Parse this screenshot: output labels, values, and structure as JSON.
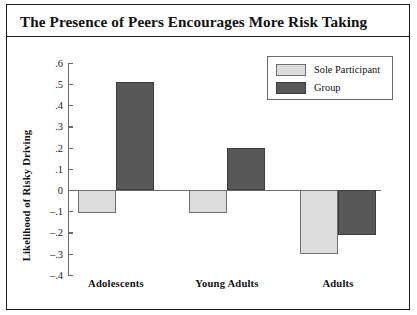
{
  "figure": {
    "title": "The Presence of Peers Encourages More Risk Taking"
  },
  "chart_data": {
    "type": "bar",
    "title": "The Presence of Peers Encourages More Risk Taking",
    "xlabel": "",
    "ylabel": "Likelihood of Risky Driving",
    "categories": [
      "Adolescents",
      "Young Adults",
      "Adults"
    ],
    "series": [
      {
        "name": "Sole Participant",
        "color": "#dcdcdc",
        "values": [
          -0.11,
          -0.11,
          -0.3
        ]
      },
      {
        "name": "Group",
        "color": "#585858",
        "values": [
          0.51,
          0.2,
          -0.21
        ]
      }
    ],
    "ylim": [
      -0.4,
      0.6
    ],
    "ytick_labels": [
      ".6",
      ".5",
      ".4",
      ".3",
      ".2",
      ".1",
      "0",
      "–.1",
      "–.2",
      "–.3",
      "–.4"
    ],
    "ytick_values": [
      0.6,
      0.5,
      0.4,
      0.3,
      0.2,
      0.1,
      0.0,
      -0.1,
      -0.2,
      -0.3,
      -0.4
    ],
    "grid": false,
    "legend_position": "top-right",
    "zero_line": true
  },
  "legend": {
    "entries": [
      {
        "label": "Sole Participant",
        "swatch": "sole"
      },
      {
        "label": "Group",
        "swatch": "group"
      }
    ]
  }
}
